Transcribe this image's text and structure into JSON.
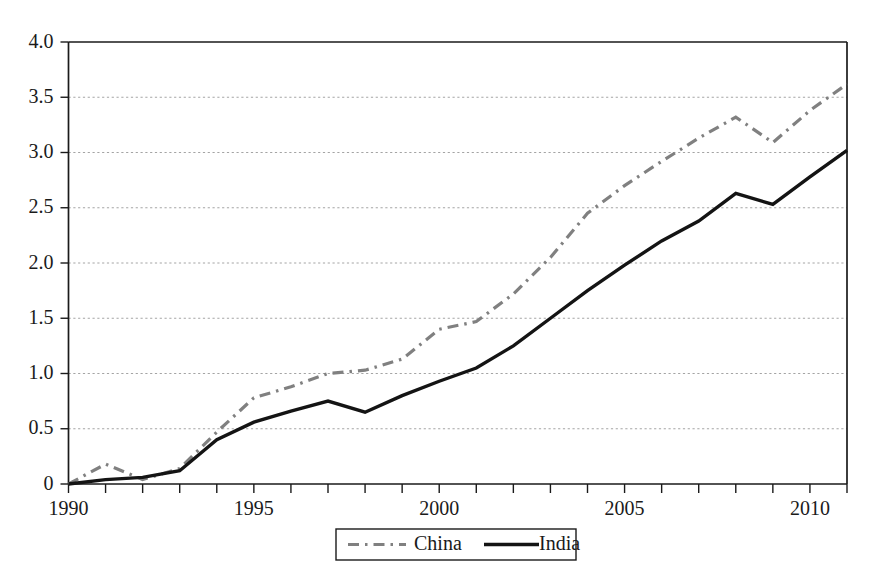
{
  "chart_data": {
    "type": "line",
    "title": "",
    "subtitle": "",
    "xlabel": "",
    "ylabel": "",
    "x": [
      1990,
      1991,
      1992,
      1993,
      1994,
      1995,
      1996,
      1997,
      1998,
      1999,
      2000,
      2001,
      2002,
      2003,
      2004,
      2005,
      2006,
      2007,
      2008,
      2009,
      2010,
      2011
    ],
    "xlim": [
      1990,
      2011
    ],
    "ylim": [
      0,
      4.0
    ],
    "xticks": [
      1990,
      1991,
      1992,
      1993,
      1994,
      1995,
      1996,
      1997,
      1998,
      1999,
      2000,
      2001,
      2002,
      2003,
      2004,
      2005,
      2006,
      2007,
      2008,
      2009,
      2010,
      2011
    ],
    "xtick_labels": [
      "1990",
      "",
      "",
      "",
      "",
      "1995",
      "",
      "",
      "",
      "",
      "2000",
      "",
      "",
      "",
      "",
      "2005",
      "",
      "",
      "",
      "",
      "2010",
      ""
    ],
    "xtick_labels_shown": [
      "1990",
      "1995",
      "2000",
      "2005",
      "2010"
    ],
    "yticks": [
      0,
      0.5,
      1.0,
      1.5,
      2.0,
      2.5,
      3.0,
      3.5,
      4.0
    ],
    "ytick_labels": [
      "0",
      "0.5",
      "1.0",
      "1.5",
      "2.0",
      "2.5",
      "3.0",
      "3.5",
      "4.0"
    ],
    "grid": "horizontal-dotted",
    "legend_position": "bottom-center",
    "series": [
      {
        "name": "China",
        "style": "dash-dot",
        "color": "#808080",
        "values": [
          0.0,
          0.18,
          0.04,
          0.14,
          0.47,
          0.78,
          0.88,
          1.0,
          1.03,
          1.13,
          1.4,
          1.47,
          1.72,
          2.05,
          2.45,
          2.7,
          2.92,
          3.13,
          3.32,
          3.09,
          3.38,
          3.62
        ]
      },
      {
        "name": "India",
        "style": "solid",
        "color": "#141414",
        "values": [
          0.0,
          0.04,
          0.06,
          0.12,
          0.4,
          0.56,
          0.66,
          0.75,
          0.65,
          0.8,
          0.93,
          1.05,
          1.25,
          1.5,
          1.75,
          1.98,
          2.2,
          2.38,
          2.63,
          2.53,
          2.78,
          3.02
        ]
      }
    ]
  },
  "legend": {
    "items": [
      {
        "label": "China",
        "swatch": "dash-dot-line-swatch"
      },
      {
        "label": "India",
        "swatch": "solid-line-swatch"
      }
    ]
  }
}
